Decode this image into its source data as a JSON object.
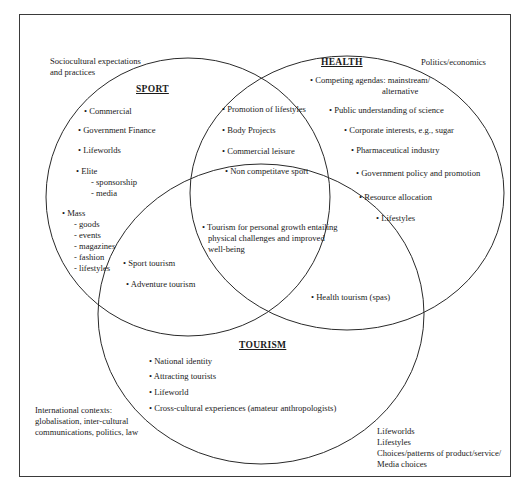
{
  "figure": {
    "type": "venn-diagram",
    "colors": {
      "line": "#2a2a2a",
      "text": "#1a1a1a",
      "background": "#ffffff"
    }
  },
  "outer_labels": {
    "top_left": [
      "Sociocultural expectations",
      "and practices"
    ],
    "top_right": "Politics/economics",
    "bottom_left": [
      "International contexts:",
      "globalisation, inter-cultural",
      "communications, politics, law"
    ],
    "bottom_right": [
      "Lifeworlds",
      "Lifestyles",
      "Choices/patterns of product/service/",
      "Media choices"
    ]
  },
  "sets": {
    "sport": {
      "title": "SPORT",
      "items": [
        "• Commercial",
        "• Government Finance",
        "• Lifeworlds",
        "• Elite"
      ],
      "elite_sub": [
        "- sponsorship",
        "- media"
      ],
      "mass_label": "• Mass",
      "mass_sub": [
        "- goods",
        "- events",
        "- magazines",
        "- fashion",
        "- lifestyles"
      ]
    },
    "health": {
      "title": "HEALTH",
      "items": [
        "• Competing agendas: mainstream/",
        "alternative",
        "• Public understanding of science",
        "• Corporate interests, e.g., sugar",
        "• Pharmaceutical industry",
        "• Government policy and promotion",
        "• Resource allocation",
        "• Lifestyles"
      ]
    },
    "tourism": {
      "title": "TOURISM",
      "items": [
        "• National identity",
        "• Attracting tourists",
        "• Lifeworld",
        "• Cross-cultural experiences (amateur anthropologists)"
      ]
    }
  },
  "intersections": {
    "sport_health": [
      "• Promotion of lifestyles",
      "• Body Projects",
      "• Commercial leisure",
      "• Non competitave sport"
    ],
    "sport_tourism": [
      "• Sport tourism",
      "• Adventure tourism"
    ],
    "health_tourism": [
      "• Health tourism (spas)"
    ],
    "all_three": [
      "• Tourism for personal growth entailing",
      "physical challenges and improved",
      "well-being"
    ]
  }
}
